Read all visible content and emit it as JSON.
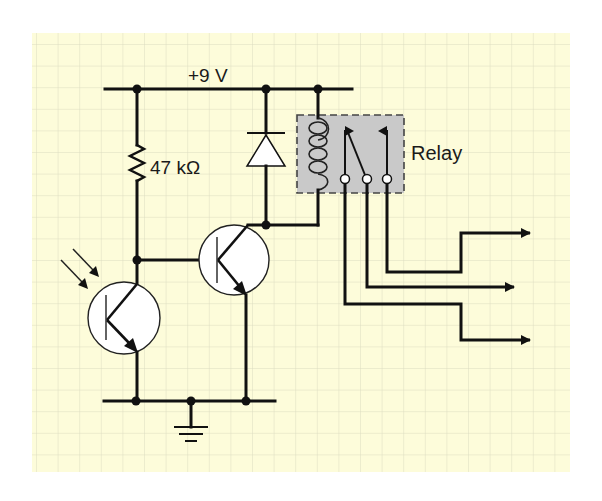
{
  "diagram": {
    "background_color": "#FDFCDA",
    "grid_color": "#DCDCC0",
    "relay_fill": "#C9C9C9",
    "wire_color": "#111111",
    "labels": {
      "supply": "+9 V",
      "resistor": "47 kΩ",
      "relay": "Relay"
    },
    "components": [
      {
        "id": "supply-rail",
        "type": "power-rail",
        "label": "+9 V"
      },
      {
        "id": "r1",
        "type": "resistor",
        "value": "47 kΩ"
      },
      {
        "id": "d1",
        "type": "diode",
        "orientation": "cathode-up"
      },
      {
        "id": "k1",
        "type": "relay",
        "label": "Relay",
        "contacts": 3
      },
      {
        "id": "q1",
        "type": "phototransistor",
        "polarity": "NPN"
      },
      {
        "id": "q2",
        "type": "transistor",
        "polarity": "NPN"
      },
      {
        "id": "gnd",
        "type": "ground"
      }
    ],
    "outputs": [
      {
        "id": "out-1",
        "from_contact": 3
      },
      {
        "id": "out-2",
        "from_contact": 2
      },
      {
        "id": "out-3",
        "from_contact": 1
      }
    ]
  }
}
